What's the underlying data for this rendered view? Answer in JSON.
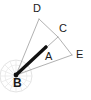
{
  "figure": {
    "kind": "geometry-diagram",
    "background_color": "#ffffff",
    "width": 91,
    "height": 100,
    "stroke_color_thin": "#a8a8a8",
    "stroke_color_thick": "#111111",
    "compass_color": "#d8d8d8",
    "label_color": "#1a1a1a"
  },
  "points": {
    "A": {
      "label": "A",
      "x": 46,
      "y": 47,
      "label_x": 45,
      "label_y": 51
    },
    "B": {
      "label": "B",
      "x": 16,
      "y": 75,
      "label_x": 13,
      "label_y": 78
    },
    "C": {
      "label": "C",
      "x": 58,
      "y": 37,
      "label_x": 59,
      "label_y": 23
    },
    "D": {
      "label": "D",
      "x": 39,
      "y": 19,
      "label_x": 33,
      "label_y": 3
    },
    "E": {
      "label": "E",
      "x": 72,
      "y": 55,
      "label_x": 76,
      "label_y": 49
    }
  },
  "segments": [
    {
      "name": "B-D",
      "from": "B",
      "to": "D",
      "style": "thin"
    },
    {
      "name": "D-C",
      "from": "D",
      "to": "C",
      "style": "thin"
    },
    {
      "name": "C-E",
      "from": "C",
      "to": "E",
      "style": "thin"
    },
    {
      "name": "B-C",
      "from": "B",
      "to": "C",
      "style": "thin"
    },
    {
      "name": "B-E",
      "from": "B",
      "to": "E",
      "style": "thin"
    },
    {
      "name": "B-A",
      "from": "B",
      "to": "A",
      "style": "thick"
    }
  ],
  "compass": {
    "name": "compass-rose",
    "center_x": 16,
    "center_y": 76,
    "radius": 16,
    "ray_count": 16
  }
}
